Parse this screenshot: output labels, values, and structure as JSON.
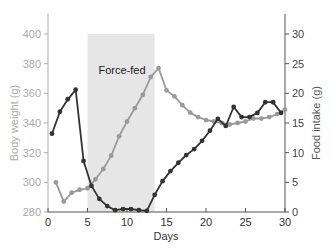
{
  "chart_data": {
    "type": "line",
    "title": "",
    "xlabel": "Days",
    "ylabel": "Body weight (g)",
    "y2label": "Food intake (g)",
    "xlim": [
      0,
      30
    ],
    "ylim": [
      280,
      410
    ],
    "y2lim": [
      0,
      32.5
    ],
    "x_ticks": [
      0,
      5,
      10,
      15,
      20,
      25,
      30
    ],
    "y_ticks": [
      280,
      300,
      320,
      340,
      360,
      380,
      400
    ],
    "y2_ticks": [
      0,
      5,
      10,
      15,
      20,
      25,
      30
    ],
    "grid": false,
    "annotations": [
      {
        "type": "shaded_region",
        "x_start": 5,
        "x_end": 13.5,
        "y_top": 400,
        "label": "Force-fed",
        "color": "#e6e6e6"
      }
    ],
    "series": [
      {
        "name": "Body weight (g)",
        "axis": "left",
        "color": "#9a9a9a",
        "x": [
          1,
          2,
          3,
          4,
          5,
          6,
          7,
          8,
          9,
          10,
          11,
          12,
          13,
          14,
          15,
          16,
          17,
          18,
          19,
          20,
          21,
          22,
          23,
          24,
          25,
          26,
          27,
          28,
          29,
          30
        ],
        "values": [
          300,
          287,
          293,
          295,
          296,
          302,
          309,
          318,
          331,
          341,
          350,
          359,
          371,
          377,
          362,
          358,
          352,
          347,
          344,
          342,
          341,
          340,
          339,
          340,
          341,
          343,
          343,
          344,
          346,
          349
        ]
      },
      {
        "name": "Food intake (g)",
        "axis": "right",
        "color": "#333333",
        "x": [
          0.5,
          1.5,
          2.5,
          3.5,
          4.5,
          5.5,
          6.5,
          7.5,
          8.5,
          9.5,
          10.5,
          11.5,
          12.5,
          13.5,
          14.5,
          15.5,
          16.5,
          17.5,
          18.5,
          19.5,
          20.5,
          21.5,
          22.5,
          23.5,
          24.5,
          25.5,
          26.5,
          27.5,
          28.5,
          29.5
        ],
        "values": [
          13.2,
          16.9,
          19.0,
          20.6,
          8.6,
          4.4,
          2.2,
          1.0,
          0.3,
          0.5,
          0.5,
          0.3,
          0.2,
          2.9,
          5.2,
          6.9,
          8.3,
          9.6,
          10.6,
          12.0,
          13.7,
          15.7,
          14.5,
          17.7,
          16.0,
          16.0,
          16.7,
          18.5,
          18.5,
          16.7
        ]
      }
    ]
  },
  "labels": {
    "x_axis": "Days",
    "y_axis_left": "Body weight (g)",
    "y_axis_right": "Food intake (g)",
    "shaded_label": "Force-fed"
  },
  "colors": {
    "left_axis": "#aaaaaa",
    "right_axis": "#555555",
    "body_weight_line": "#9a9a9a",
    "food_intake_line": "#333333",
    "shade": "#e6e6e6"
  }
}
